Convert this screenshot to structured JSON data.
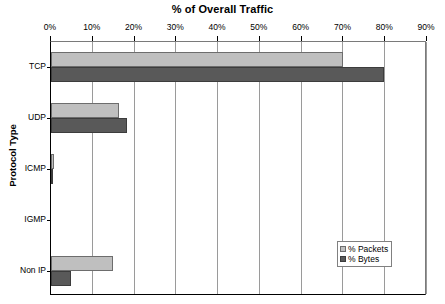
{
  "chart_data": {
    "type": "bar",
    "orientation": "horizontal",
    "title": "% of Overall Traffic",
    "xlabel": "",
    "ylabel": "Protocol Type",
    "categories": [
      "TCP",
      "UDP",
      "ICMP",
      "IGMP",
      "Non IP"
    ],
    "xlim": [
      0,
      90
    ],
    "xticks": [
      0,
      10,
      20,
      30,
      40,
      50,
      60,
      70,
      80,
      90
    ],
    "xticklabels": [
      "0%",
      "10%",
      "20%",
      "30%",
      "40%",
      "50%",
      "60%",
      "70%",
      "80%",
      "90%"
    ],
    "grid": true,
    "grid_axis": "x",
    "legend_position": "lower-right",
    "series": [
      {
        "name": "% Packets",
        "color": "#bfbfbf",
        "values": [
          69.8,
          16.3,
          0.6,
          0.0,
          14.9
        ]
      },
      {
        "name": "% Bytes",
        "color": "#595959",
        "values": [
          79.6,
          18.2,
          0.1,
          0.0,
          4.8
        ]
      }
    ]
  },
  "legend": {
    "items": [
      {
        "label": "% Packets"
      },
      {
        "label": "% Bytes"
      }
    ]
  },
  "colors": {
    "packets": "#bfbfbf",
    "bytes": "#595959",
    "axis": "#000000",
    "gridline": "#9a9a9a",
    "background": "#ffffff"
  }
}
